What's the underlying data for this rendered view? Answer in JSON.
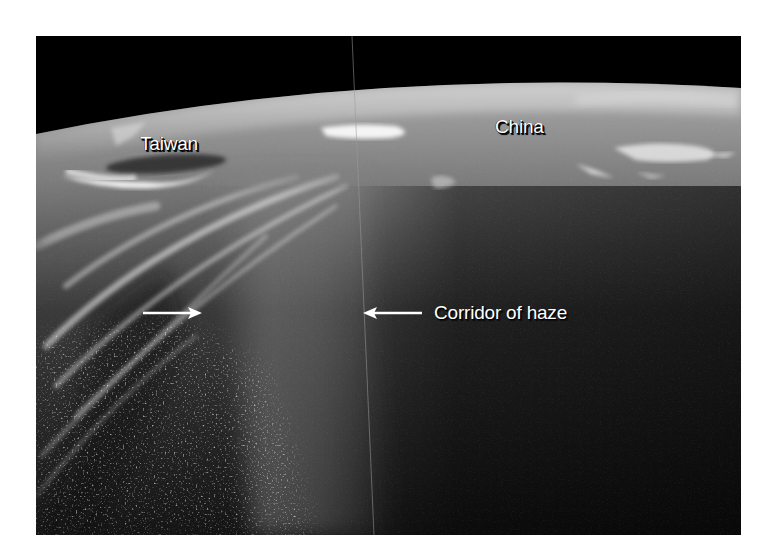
{
  "figure": {
    "labels": {
      "taiwan": "Taiwan",
      "china": "China",
      "haze": "Corridor of haze"
    },
    "arrows": [
      {
        "direction": "right",
        "points_to": "left edge of haze corridor"
      },
      {
        "direction": "left",
        "points_to": "right edge of haze corridor"
      }
    ],
    "colors": {
      "space": "#000000",
      "land_haze": "#9a9a9a",
      "ocean_dark": "#1a1a1a",
      "cloud": "#e8e8e8",
      "label_text": "#ffffff",
      "page_background": "#ffffff"
    }
  }
}
